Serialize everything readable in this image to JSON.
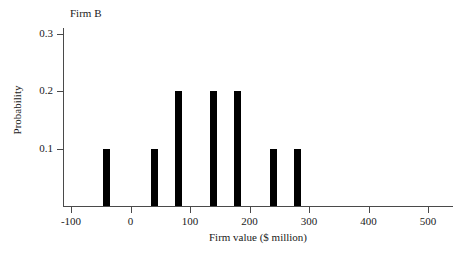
{
  "chart_data": {
    "type": "bar",
    "title": "Firm B",
    "xlabel": "Firm value ($ million)",
    "ylabel": "Probability",
    "x": [
      -40,
      40,
      80,
      140,
      180,
      240,
      280
    ],
    "values": [
      0.1,
      0.1,
      0.2,
      0.2,
      0.2,
      0.1,
      0.1
    ],
    "categories": [
      "-40",
      "40",
      "80",
      "140",
      "180",
      "240",
      "280"
    ],
    "xlim": [
      -130,
      520
    ],
    "ylim": [
      0,
      0.3
    ],
    "xticks": [
      -100,
      0,
      100,
      200,
      300,
      400,
      500
    ],
    "xtick_labels": [
      "-100",
      "0",
      "100",
      "200",
      "300",
      "400",
      "500"
    ],
    "yticks": [
      0.1,
      0.2,
      0.3
    ],
    "ytick_labels": [
      "0.1",
      "0.2",
      "0.3"
    ],
    "grid": false,
    "legend": false,
    "bar_color": "#000000",
    "axis_color": "#4a4a4a"
  }
}
